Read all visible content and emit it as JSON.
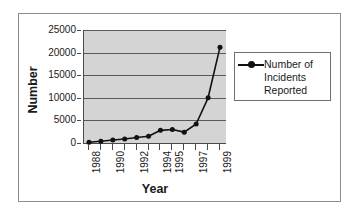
{
  "chart_data": {
    "type": "line",
    "title": "",
    "xlabel": "Year",
    "ylabel": "Number",
    "categories": [
      "1988",
      "1989",
      "1990",
      "1991",
      "1992",
      "1993",
      "1994",
      "1995",
      "1996",
      "1997",
      "1998",
      "1999"
    ],
    "x_tick_labels_shown": [
      "1988",
      "",
      "1990",
      "",
      "1992",
      "",
      "1994",
      "1995",
      "",
      "1997",
      "",
      "1999"
    ],
    "series": [
      {
        "name": "Number of Incidents Reported",
        "values": [
          150,
          400,
          650,
          900,
          1200,
          1500,
          2800,
          3000,
          2400,
          4200,
          10000,
          21200
        ]
      }
    ],
    "ylim": [
      0,
      25000
    ],
    "y_ticks": [
      0,
      5000,
      10000,
      15000,
      20000,
      25000
    ],
    "y_tick_labels": [
      "0",
      "5000",
      "10000",
      "15000",
      "20000",
      "25000"
    ],
    "grid": "horizontal",
    "legend_position": "right",
    "legend_entries": [
      "Number of Incidents Reported"
    ],
    "plot_background_color": "#d4d4d4",
    "line_color": "#111111",
    "marker_color": "#111111",
    "marker_style": "circle"
  },
  "legend": {
    "label": "Number of\nIncidents\nReported",
    "symbol_name": "line-marker-symbol"
  },
  "axes": {
    "y_title": "Number",
    "x_title": "Year"
  }
}
